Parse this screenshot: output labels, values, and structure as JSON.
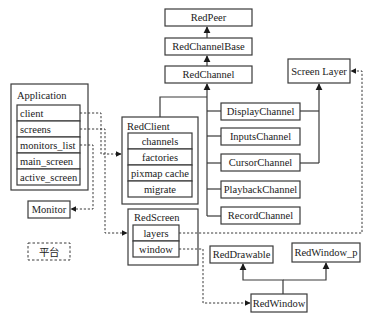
{
  "diagram": {
    "nodes": {
      "red_peer": {
        "label": "RedPeer"
      },
      "red_channel_base": {
        "label": "RedChannelBase"
      },
      "red_channel": {
        "label": "RedChannel"
      },
      "screen_layer": {
        "label": "Screen Layer"
      },
      "application": {
        "label": "Application",
        "fields": [
          "client",
          "screens",
          "monitors_list",
          "main_screen",
          "active_screen"
        ]
      },
      "red_client": {
        "label": "RedClient",
        "fields": [
          "channels",
          "factories",
          "pixmap cache",
          "migrate"
        ]
      },
      "channels": [
        "DisplayChannel",
        "InputsChannel",
        "CursorChannel",
        "PlaybackChannel",
        "RecordChannel"
      ],
      "monitor": {
        "label": "Monitor"
      },
      "platform": {
        "label": "平台"
      },
      "red_screen": {
        "label": "RedScreen",
        "fields": [
          "layers",
          "window"
        ]
      },
      "red_drawable": {
        "label": "RedDrawable"
      },
      "red_window_p": {
        "label": "RedWindow_p"
      },
      "red_window": {
        "label": "RedWindow"
      }
    },
    "edges": [
      {
        "from": "RedChannelBase",
        "to": "RedPeer",
        "type": "inheritance"
      },
      {
        "from": "RedChannel",
        "to": "RedChannelBase",
        "type": "inheritance"
      },
      {
        "from": "DisplayChannel",
        "to": "RedChannel",
        "type": "inheritance"
      },
      {
        "from": "InputsChannel",
        "to": "RedChannel",
        "type": "inheritance"
      },
      {
        "from": "CursorChannel",
        "to": "RedChannel",
        "type": "inheritance"
      },
      {
        "from": "PlaybackChannel",
        "to": "RedChannel",
        "type": "inheritance"
      },
      {
        "from": "RecordChannel",
        "to": "RedChannel",
        "type": "inheritance"
      },
      {
        "from": "RedClient",
        "to": "RedChannel",
        "type": "association"
      },
      {
        "from": "DisplayChannel",
        "to": "Screen Layer",
        "type": "inheritance"
      },
      {
        "from": "CursorChannel",
        "to": "Screen Layer",
        "type": "inheritance"
      },
      {
        "from": "Application.client",
        "to": "RedClient",
        "type": "reference"
      },
      {
        "from": "Application.screens",
        "to": "RedScreen",
        "type": "reference"
      },
      {
        "from": "Application.monitors_list",
        "to": "Monitor",
        "type": "reference"
      },
      {
        "from": "RedScreen.layers",
        "to": "Screen Layer",
        "type": "reference"
      },
      {
        "from": "RedScreen.window",
        "to": "RedWindow",
        "type": "reference"
      },
      {
        "from": "RedWindow",
        "to": "RedDrawable",
        "type": "inheritance"
      },
      {
        "from": "RedWindow",
        "to": "RedWindow_p",
        "type": "inheritance"
      }
    ]
  }
}
